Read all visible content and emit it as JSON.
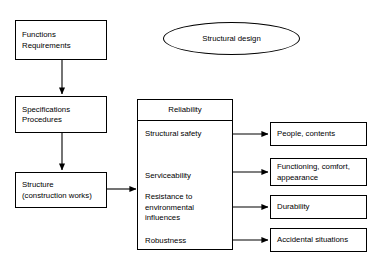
{
  "diagram": {
    "background_color": "#ffffff",
    "line_color": "#000000",
    "flow": {
      "label_1": "Functions\nRequirements",
      "label_2": "Specifications\nProcedures",
      "label_3": "Structure\n(construction works)"
    },
    "ellipse": {
      "label": "Structural design"
    },
    "reliability_panel": {
      "header": "Reliability",
      "items": [
        {
          "label": "Structural safety"
        },
        {
          "label": "Serviceability"
        },
        {
          "label": "Resistance to\nenvironmental\ninfluences"
        },
        {
          "label": "Robustness"
        }
      ]
    },
    "outcomes": [
      {
        "label": "People, contents"
      },
      {
        "label": "Functioning, comfort,\nappearance"
      },
      {
        "label": "Durability"
      },
      {
        "label": "Accidental situations"
      }
    ]
  }
}
